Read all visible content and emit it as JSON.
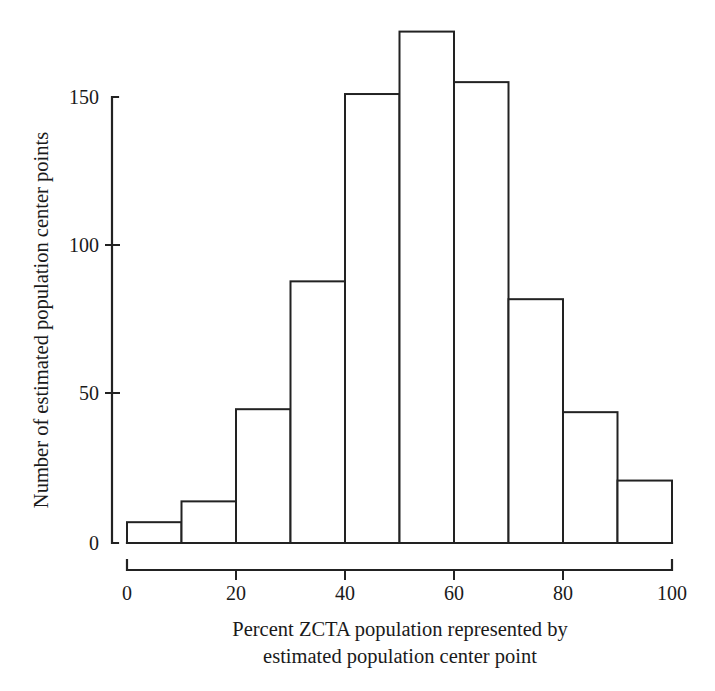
{
  "chart_data": {
    "type": "bar",
    "title": "",
    "subtitle": "",
    "xlabel_line1": "Percent ZCTA population represented by",
    "xlabel_line2": "estimated population center point",
    "ylabel": "Number of estimated population center points",
    "categories": [
      "0-10",
      "10-20",
      "20-30",
      "30-40",
      "40-50",
      "50-60",
      "60-70",
      "70-80",
      "80-90",
      "90-100"
    ],
    "bin_edges": [
      0,
      10,
      20,
      30,
      40,
      50,
      60,
      70,
      80,
      90,
      100
    ],
    "values": [
      7,
      14,
      45,
      88,
      151,
      172,
      155,
      82,
      44,
      21
    ],
    "xlim": [
      0,
      100
    ],
    "ylim": [
      0,
      175
    ],
    "x_tick_labels": [
      "0",
      "20",
      "40",
      "60",
      "80",
      "100"
    ],
    "x_tick_values": [
      0,
      20,
      40,
      60,
      80,
      100
    ],
    "x_minor_tick_values": [
      0,
      10,
      20,
      30,
      40,
      50,
      60,
      70,
      80,
      90,
      100
    ],
    "y_tick_labels": [
      "0",
      "50",
      "100",
      "150"
    ],
    "y_tick_values": [
      0,
      50,
      100,
      150
    ],
    "grid": "off",
    "legend": "none",
    "bar_fill_color": "#ffffff",
    "bar_stroke_color": "#222222",
    "axis_color": "#222222",
    "background_color": "#ffffff"
  }
}
